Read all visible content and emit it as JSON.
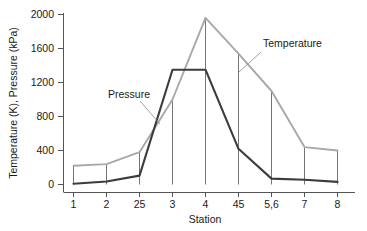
{
  "chart_data": {
    "type": "line",
    "title": "",
    "subtitle": "",
    "xlabel": "Station",
    "ylabel": "Temperature (K), Pressure (kPa)",
    "x_tick_labels": [
      "1",
      "2",
      "25",
      "3",
      "4",
      "45",
      "5,6",
      "7",
      "8"
    ],
    "y_tick_labels": [
      "0",
      "400",
      "800",
      "1200",
      "1600",
      "2000"
    ],
    "y_ticks": [
      0,
      400,
      800,
      1200,
      1600,
      2000
    ],
    "ylim": [
      0,
      2000
    ],
    "grid": false,
    "legend_position": "inline-annotations",
    "series": [
      {
        "name": "Temperature",
        "color": "#a8a8a8",
        "unit": "K",
        "values": [
          220,
          240,
          380,
          1000,
          1960,
          1540,
          1100,
          440,
          400
        ]
      },
      {
        "name": "Pressure",
        "color": "#3c3c3c",
        "unit": "kPa",
        "values": [
          10,
          35,
          105,
          1350,
          1350,
          420,
          70,
          55,
          30
        ]
      }
    ],
    "annotations": [
      {
        "text": "Pressure",
        "series": "Pressure"
      },
      {
        "text": "Temperature",
        "series": "Temperature"
      }
    ]
  }
}
